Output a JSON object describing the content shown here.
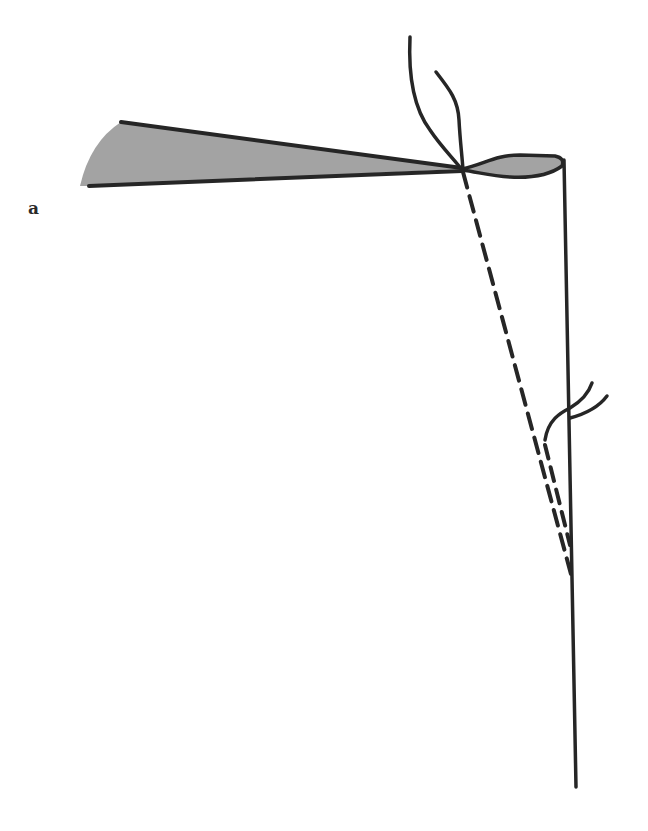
{
  "figure": {
    "panel_label": "a",
    "colors": {
      "stroke": "#262626",
      "wedge_fill": "#a3a3a3",
      "background": "#ffffff"
    },
    "elements": [
      {
        "id": "shaded-wedge",
        "type": "filled-sector",
        "description": "gray wedge tapering to a knot point"
      },
      {
        "id": "knot-loop",
        "type": "filled-lobe",
        "description": "small gray loop right of the crossing point"
      },
      {
        "id": "vertical-line",
        "type": "solid-line",
        "description": "long vertical line descending from loop"
      },
      {
        "id": "dashed-line-1",
        "type": "dashed-line",
        "description": "dashed diagonal from crossing point down to the vertical line"
      },
      {
        "id": "dashed-line-2",
        "type": "dashed-line",
        "description": "second dashed strand near vertical line"
      },
      {
        "id": "upper-threads",
        "type": "curves",
        "description": "two loose thread ends rising above crossing point"
      },
      {
        "id": "lower-threads",
        "type": "curves",
        "description": "two loose thread ends crossing the vertical line"
      }
    ]
  }
}
